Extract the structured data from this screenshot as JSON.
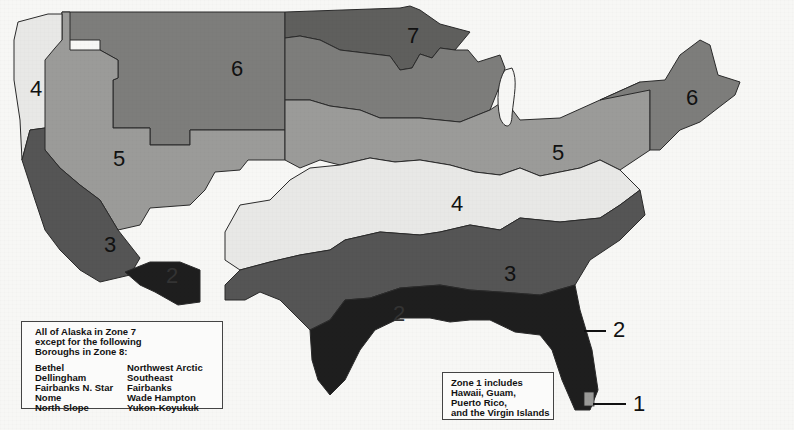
{
  "map": {
    "title": "Climate Zones of the United States",
    "colors": {
      "zone1": "#9a9a98",
      "zone2": "#1e1e1e",
      "zone3": "#555555",
      "zone4": "#e8e8e6",
      "zone5": "#9b9b99",
      "zone6": "#7d7d7b",
      "zone7": "#5f5f5d",
      "border": "#2a2a2a",
      "water": "#f7f7f5"
    },
    "zone_labels": [
      {
        "id": "zone-4-west",
        "text": "4"
      },
      {
        "id": "zone-6-northwest",
        "text": "6"
      },
      {
        "id": "zone-7-north",
        "text": "7"
      },
      {
        "id": "zone-6-northeast",
        "text": "6"
      },
      {
        "id": "zone-5-west",
        "text": "5"
      },
      {
        "id": "zone-5-midwest",
        "text": "5"
      },
      {
        "id": "zone-4-central",
        "text": "4"
      },
      {
        "id": "zone-3-west",
        "text": "3"
      },
      {
        "id": "zone-2-southwest",
        "text": "2"
      },
      {
        "id": "zone-3-southeast",
        "text": "3"
      },
      {
        "id": "zone-2-gulf",
        "text": "2"
      }
    ],
    "callouts": [
      {
        "id": "callout-zone-2",
        "text": "2"
      },
      {
        "id": "callout-zone-1",
        "text": "1"
      }
    ]
  },
  "alaska_note": {
    "heading": [
      "All of Alaska in Zone 7",
      "except for the following",
      "Boroughs in Zone 8:"
    ],
    "boroughs_col1": [
      "Bethel",
      "Dellingham",
      "Fairbanks N. Star",
      "Nome",
      "North Slope"
    ],
    "boroughs_col2": [
      "Northwest Arctic",
      "Southeast Fairbanks",
      "Wade Hampton",
      "Yukon-Koyukuk"
    ]
  },
  "zone1_note": {
    "lines": [
      "Zone 1 includes",
      "Hawaii, Guam,",
      "Puerto Rico,",
      "and the Virgin Islands"
    ]
  }
}
